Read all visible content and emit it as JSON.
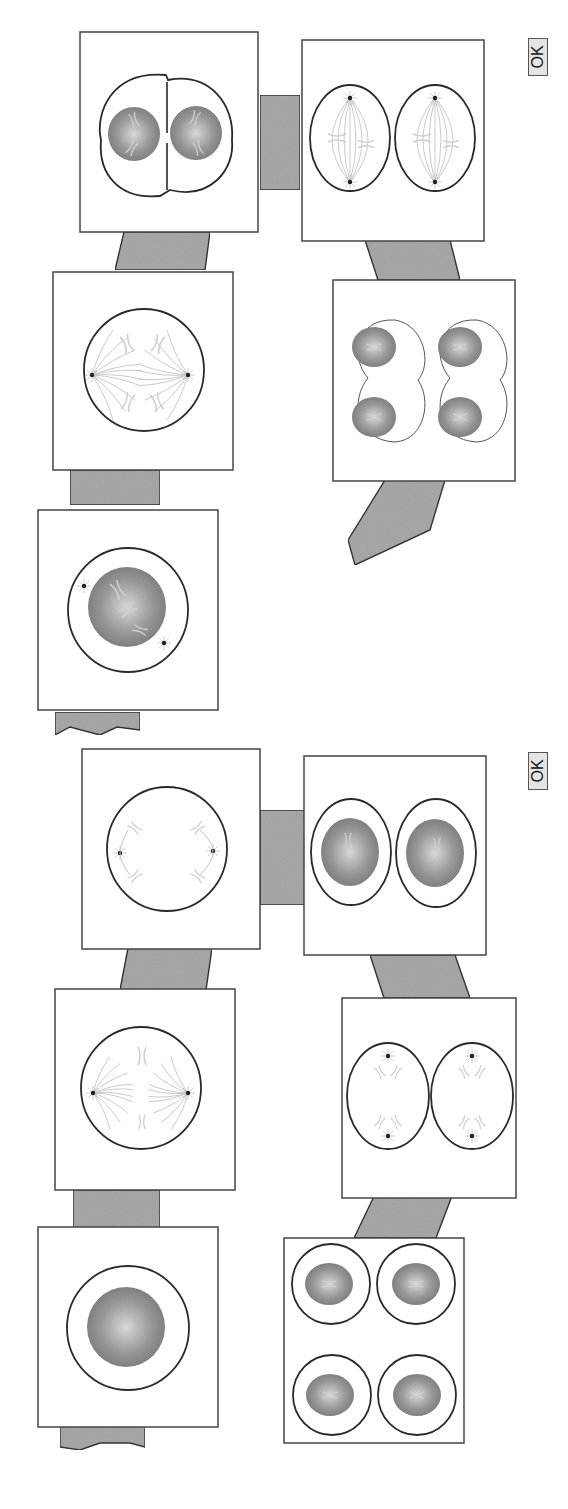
{
  "colors": {
    "background": "#ffffff",
    "connector_fill": "#a8a8a8",
    "connector_stroke": "#333333",
    "box_stroke": "#444444",
    "membrane_stroke": "#2a2a2a",
    "nucleus_dark": "#8a8a8a",
    "nucleus_light": "#d9d9d9",
    "chromosome": "#cfcfcf",
    "spindle": "#c4c4c4",
    "centrosome": "#222222",
    "button_bg": "#e4e4e4"
  },
  "panels": [
    {
      "id": "meiosis",
      "ok_label": "OK",
      "stages": [
        {
          "name": "prophase-i",
          "type": "prophase",
          "note": "nucleus with duplicated chromosomes and two centrosomes"
        },
        {
          "name": "anaphase-i",
          "type": "anaphase",
          "note": "homologs pulled toward poles"
        },
        {
          "name": "telophase-i",
          "type": "telophase-pinch",
          "note": "two nuclei in pinching cell"
        },
        {
          "name": "metaphase-ii",
          "type": "double-spindle",
          "note": "two cells with spindles"
        },
        {
          "name": "telophase-ii",
          "type": "four-nuclei-pinch",
          "note": "four nuclei in two pinching cells"
        },
        {
          "name": "exit-arrow",
          "type": "arrow"
        }
      ]
    },
    {
      "id": "mitosis",
      "ok_label": "OK",
      "stages": [
        {
          "name": "interphase",
          "type": "interphase",
          "note": "single nucleus"
        },
        {
          "name": "metaphase",
          "type": "metaphase",
          "note": "chromosomes at plate, spindle poles"
        },
        {
          "name": "anaphase",
          "type": "anaphase-late",
          "note": "chromatids at poles"
        },
        {
          "name": "daughter-cells",
          "type": "two-nuclei",
          "note": "two separate cells with nuclei"
        },
        {
          "name": "telophase-two-cells",
          "type": "two-cell-poles",
          "note": "two cells with separated chromatids"
        },
        {
          "name": "four-cells",
          "type": "four-cells",
          "note": "four daughter cells"
        }
      ]
    }
  ]
}
